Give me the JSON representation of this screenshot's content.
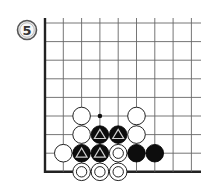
{
  "diagram": {
    "label": "5",
    "type": "go-board-corner",
    "grid": {
      "x_lines": [
        45,
        63.3,
        81.6,
        99.9,
        118.2,
        136.5,
        154.8,
        173.1,
        191.4
      ],
      "y_lines": [
        23,
        41.6,
        60.2,
        78.8,
        97.4,
        116,
        134.6,
        153.2,
        171.8
      ],
      "left_edge": true,
      "bottom_edge": true,
      "right_extent": 201,
      "top_extent": 18
    },
    "stones": [
      {
        "col": 2,
        "row": 5,
        "color": "white",
        "mark": "none"
      },
      {
        "col": 5,
        "row": 5,
        "color": "white",
        "mark": "none"
      },
      {
        "col": 2,
        "row": 6,
        "color": "white",
        "mark": "none"
      },
      {
        "col": 3,
        "row": 6,
        "color": "black",
        "mark": "triangle"
      },
      {
        "col": 4,
        "row": 6,
        "color": "black",
        "mark": "triangle"
      },
      {
        "col": 5,
        "row": 6,
        "color": "white",
        "mark": "none"
      },
      {
        "col": 1,
        "row": 7,
        "color": "white",
        "mark": "none"
      },
      {
        "col": 2,
        "row": 7,
        "color": "black",
        "mark": "triangle"
      },
      {
        "col": 3,
        "row": 7,
        "color": "black",
        "mark": "triangle"
      },
      {
        "col": 4,
        "row": 7,
        "color": "white",
        "mark": "circle"
      },
      {
        "col": 5,
        "row": 7,
        "color": "black",
        "mark": "none"
      },
      {
        "col": 6,
        "row": 7,
        "color": "black",
        "mark": "none"
      },
      {
        "col": 2,
        "row": 8,
        "color": "white",
        "mark": "circle"
      },
      {
        "col": 3,
        "row": 8,
        "color": "white",
        "mark": "circle"
      },
      {
        "col": 4,
        "row": 8,
        "color": "white",
        "mark": "circle"
      }
    ],
    "points": [
      {
        "col": 3,
        "row": 5,
        "mark": "dot"
      }
    ]
  }
}
